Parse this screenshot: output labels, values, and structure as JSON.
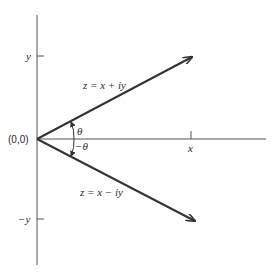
{
  "diagram": {
    "origin_label": "(0,0)",
    "x_tick_label": "x",
    "y_tick_label": "y",
    "neg_y_tick_label": "−y",
    "upper_vector_label": "z = x + iy",
    "lower_vector_label": "z = x − iy",
    "angle_upper_label": "θ",
    "angle_lower_label": "−θ",
    "line_color": "#333333"
  }
}
